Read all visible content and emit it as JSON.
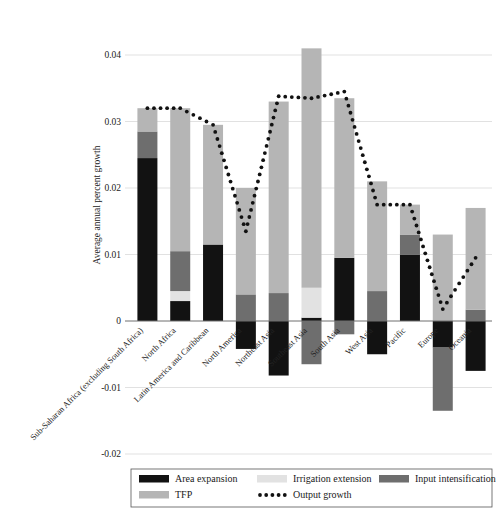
{
  "chart_data": {
    "type": "bar",
    "title": "",
    "subtitle": "",
    "xlabel": "",
    "ylabel": "Average annual percent growth",
    "ylim": [
      -0.02,
      0.045
    ],
    "yticks": [
      -0.02,
      -0.01,
      0,
      0.01,
      0.02,
      0.03,
      0.04
    ],
    "ytick_labels": [
      "-0.02",
      "-0.01",
      "0",
      "0.01",
      "0.02",
      "0.03",
      "0.04"
    ],
    "grid": true,
    "stacked": true,
    "legend_position": "bottom",
    "categories": [
      "Sub-Saharan Africa (excluding South Africa)",
      "North Africa",
      "Latin America and Caribbean",
      "North America",
      "Northeast Asia",
      "Southeast Asia",
      "South Asia",
      "West Asia",
      "Pacific",
      "Europe",
      "Oceania"
    ],
    "series": [
      {
        "name": "Area expansion",
        "color": "#121212",
        "values": [
          0.0245,
          0.003,
          0.0115,
          -0.0042,
          -0.0082,
          0.0005,
          0.0095,
          -0.005,
          0.01,
          -0.004,
          -0.0075
        ]
      },
      {
        "name": "Irrigation extension",
        "color": "#e2e2e2",
        "values": [
          0.0,
          0.0015,
          0.0,
          0.0,
          0.0,
          0.0045,
          0.0,
          0.0,
          0.0,
          0.0,
          0.0
        ]
      },
      {
        "name": "Input intensification",
        "color": "#6e6e6e",
        "values": [
          0.004,
          0.006,
          0.0,
          0.004,
          0.0042,
          -0.0065,
          -0.002,
          0.0045,
          0.003,
          -0.0095,
          0.0017
        ]
      },
      {
        "name": "TFP",
        "color": "#b5b5b5",
        "values": [
          0.0035,
          0.0215,
          0.018,
          0.016,
          0.0288,
          0.036,
          0.024,
          0.0165,
          0.0045,
          0.013,
          0.0153
        ]
      }
    ],
    "line_series": {
      "name": "Output growth",
      "style": "dotted",
      "color": "#111111",
      "values": [
        0.032,
        0.032,
        0.0295,
        0.0135,
        0.0338,
        0.0335,
        0.0345,
        0.0175,
        0.0175,
        0.0018,
        0.0095
      ]
    },
    "bar_tops": [
      0.032,
      0.032,
      0.0295,
      0.02,
      0.033,
      0.041,
      0.0335,
      0.021,
      0.0175,
      0.013,
      0.017
    ],
    "bar_bottoms": [
      0.0,
      0.0,
      0.0,
      -0.0042,
      -0.0082,
      -0.0065,
      -0.002,
      -0.005,
      0.0,
      -0.0135,
      -0.0075
    ]
  },
  "legend": {
    "items": [
      {
        "label": "Area expansion",
        "color": "#121212",
        "marker": "swatch"
      },
      {
        "label": "Irrigation extension",
        "color": "#e2e2e2",
        "marker": "swatch"
      },
      {
        "label": "Input intensification",
        "color": "#6e6e6e",
        "marker": "swatch"
      },
      {
        "label": "TFP",
        "color": "#b5b5b5",
        "marker": "swatch"
      },
      {
        "label": "Output growth",
        "color": "#111111",
        "marker": "dotted-line"
      }
    ]
  },
  "axis": {
    "ylabel": "Average annual percent growth",
    "ytick_labels": [
      "0.04",
      "0.03",
      "0.02",
      "0.01",
      "0",
      "-0.01",
      "-0.02"
    ]
  }
}
